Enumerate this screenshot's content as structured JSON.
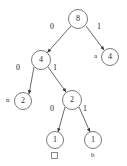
{
  "diagram": {
    "type": "huffman-tree",
    "title": "",
    "background_color": "#ffffff",
    "node_stroke_color": "#7a7a7a",
    "edge_color": "#555555",
    "text_color": "#2b2b2b",
    "nodes": [
      {
        "id": "root",
        "weight": "8",
        "x": 78,
        "y": 19,
        "r": 10,
        "kind": "internal"
      },
      {
        "id": "n4L",
        "weight": "4",
        "x": 41,
        "y": 60,
        "r": 10,
        "kind": "internal"
      },
      {
        "id": "n4R",
        "weight": "4",
        "x": 110,
        "y": 57,
        "r": 9,
        "kind": "leaf"
      },
      {
        "id": "n2L",
        "weight": "2",
        "x": 23,
        "y": 101,
        "r": 9,
        "kind": "leaf"
      },
      {
        "id": "n2R",
        "weight": "2",
        "x": 72,
        "y": 100,
        "r": 10,
        "kind": "internal"
      },
      {
        "id": "n1L",
        "weight": "1",
        "x": 55,
        "y": 140,
        "r": 9,
        "kind": "leaf"
      },
      {
        "id": "n1R",
        "weight": "1",
        "x": 93,
        "y": 140,
        "r": 9,
        "kind": "leaf"
      }
    ],
    "edges": [
      {
        "from": "root",
        "to": "n4L",
        "bit": "0",
        "label_x": 52,
        "label_y": 27
      },
      {
        "from": "root",
        "to": "n4R",
        "bit": "1",
        "label_x": 98,
        "label_y": 27
      },
      {
        "from": "n4L",
        "to": "n2L",
        "bit": "0",
        "label_x": 18,
        "label_y": 68
      },
      {
        "from": "n4L",
        "to": "n2R",
        "bit": "1",
        "label_x": 54,
        "label_y": 68
      },
      {
        "from": "n2R",
        "to": "n1L",
        "bit": "0",
        "label_x": 52,
        "label_y": 110
      },
      {
        "from": "n2R",
        "to": "n1R",
        "bit": "1",
        "label_x": 85,
        "label_y": 110
      }
    ],
    "symbols": [
      {
        "for": "n4R",
        "text": "a",
        "x": 95,
        "y": 54,
        "is_box": false
      },
      {
        "for": "n2L",
        "text": "n",
        "x": 6,
        "y": 98,
        "is_box": false
      },
      {
        "for": "n1L",
        "text": "",
        "x": 52,
        "y": 153,
        "is_box": true
      },
      {
        "for": "n1R",
        "text": "b",
        "x": 91,
        "y": 153,
        "is_box": false
      }
    ]
  }
}
